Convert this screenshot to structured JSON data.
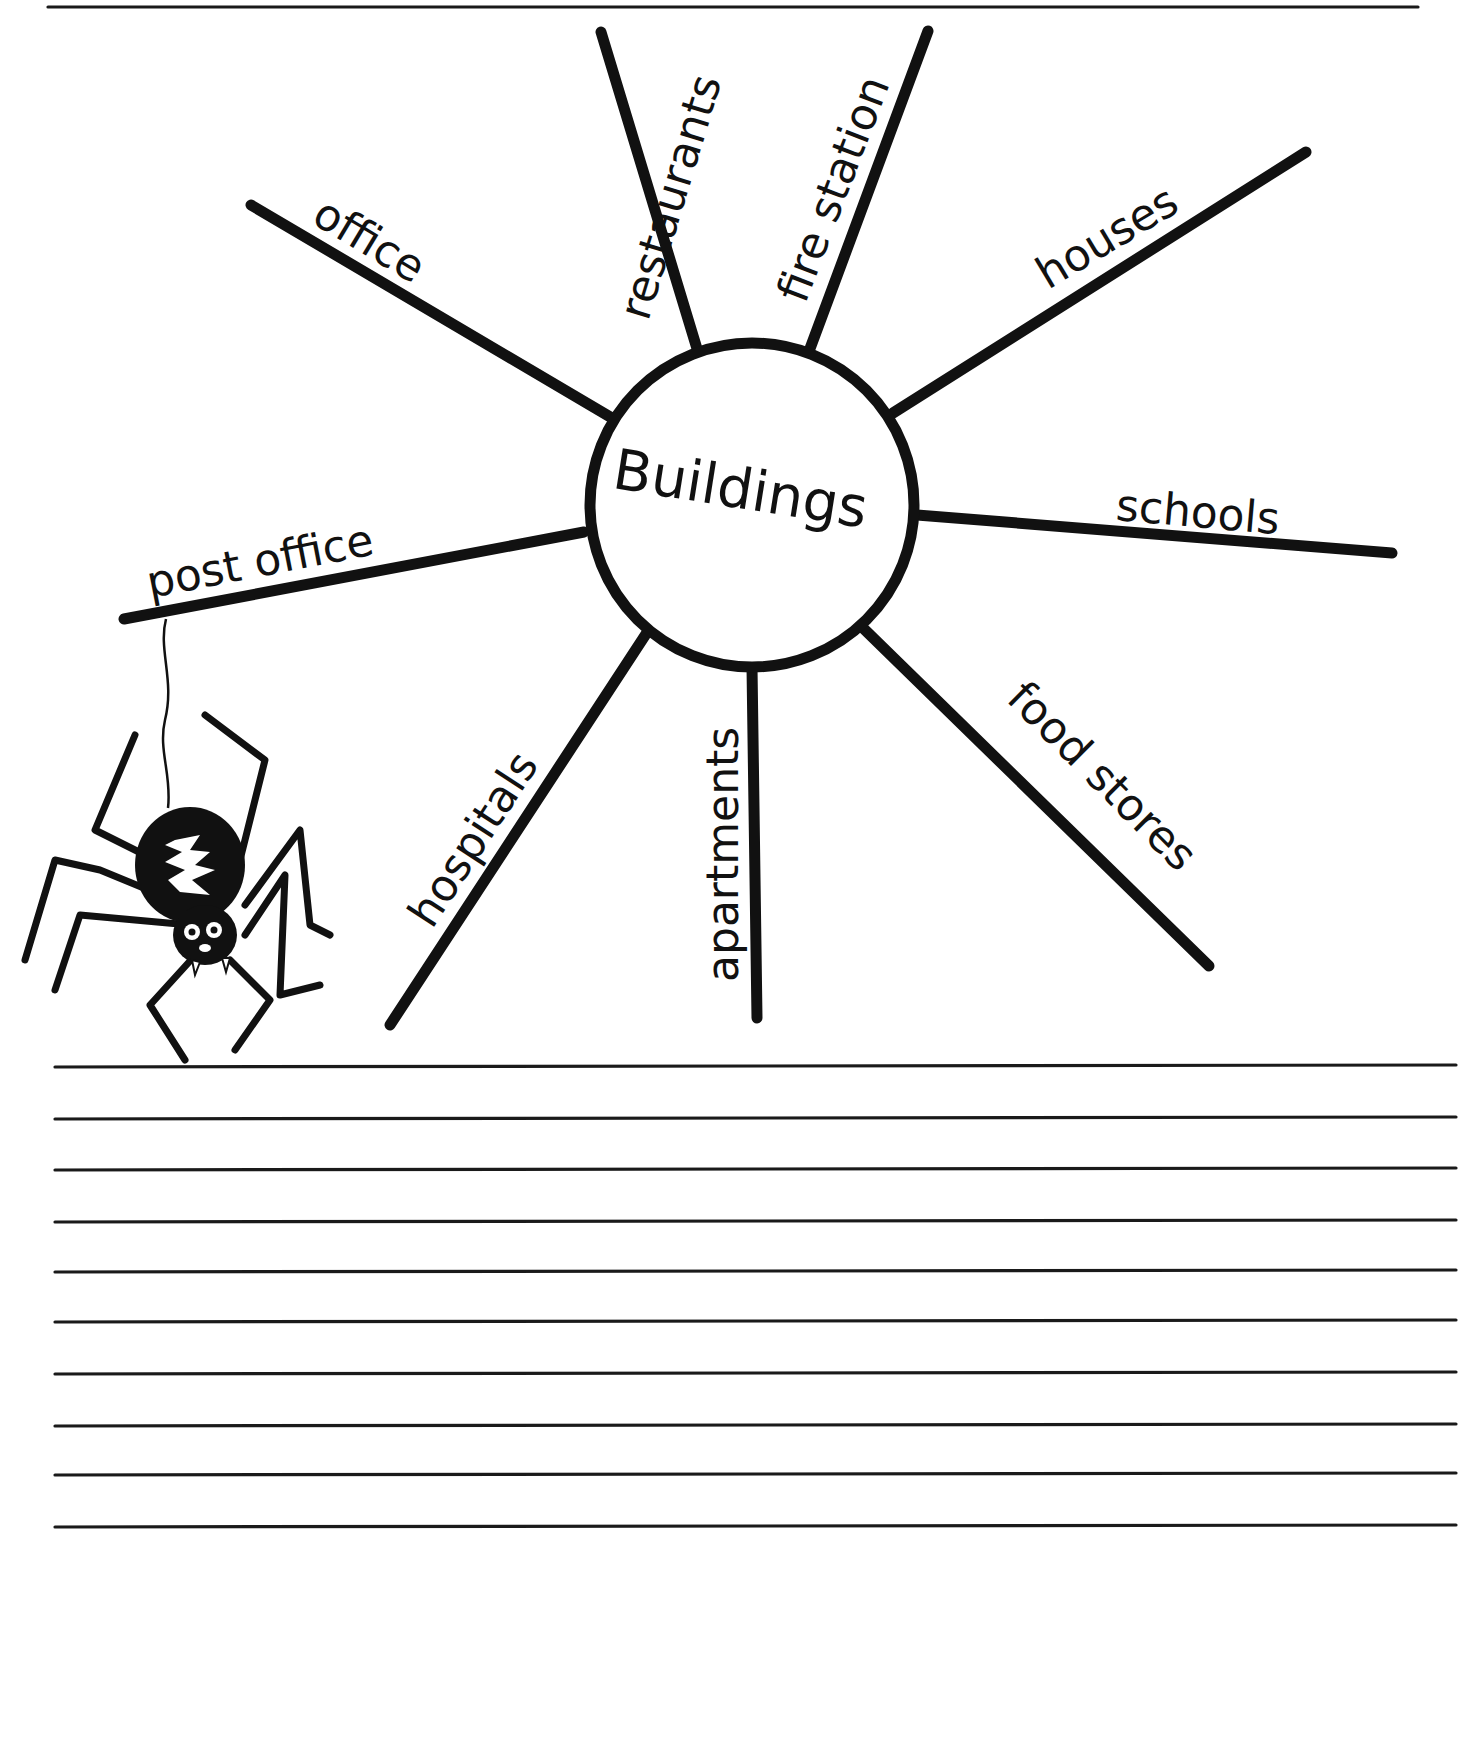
{
  "worksheet": {
    "type": "word web",
    "center": {
      "label": "Buildings",
      "cx": 752,
      "cy": 505,
      "r": 162
    },
    "rays": [
      {
        "label": "office",
        "x1": 612,
        "y1": 418,
        "x2": 251,
        "y2": 205,
        "tx": 310,
        "ty": 222,
        "rot": 31
      },
      {
        "label": "restaurants",
        "x1": 698,
        "y1": 352,
        "x2": 601,
        "y2": 32,
        "tx": 648,
        "ty": 322,
        "rot": -73
      },
      {
        "label": "fire station",
        "x1": 808,
        "y1": 354,
        "x2": 928,
        "y2": 31,
        "tx": 805,
        "ty": 305,
        "rot": -69
      },
      {
        "label": "houses",
        "x1": 893,
        "y1": 413,
        "x2": 1306,
        "y2": 152,
        "tx": 1048,
        "ty": 290,
        "rot": -31
      },
      {
        "label": "schools",
        "x1": 917,
        "y1": 515,
        "x2": 1392,
        "y2": 553,
        "tx": 1115,
        "ty": 520,
        "rot": 5
      },
      {
        "label": "food stores",
        "x1": 862,
        "y1": 627,
        "x2": 1209,
        "y2": 966,
        "tx": 1005,
        "ty": 700,
        "rot": 45
      },
      {
        "label": "apartments",
        "x1": 752,
        "y1": 667,
        "x2": 757,
        "y2": 1018,
        "tx": 738,
        "ty": 982,
        "rot": -90
      },
      {
        "label": "hospitals",
        "x1": 646,
        "y1": 634,
        "x2": 390,
        "y2": 1025,
        "tx": 432,
        "ty": 930,
        "rot": -57
      },
      {
        "label": "post office",
        "x1": 584,
        "y1": 532,
        "x2": 124,
        "y2": 619,
        "tx": 150,
        "ty": 598,
        "rot": -11
      }
    ],
    "writing_lines": [
      1066,
      1118,
      1169,
      1221,
      1271,
      1321,
      1373,
      1425,
      1474,
      1526
    ],
    "top_rule_y": 7,
    "ink_color": "#111111",
    "paper_color": "#ffffff",
    "decoration": {
      "icon": "spider-icon",
      "hangs_from": "post office"
    }
  }
}
